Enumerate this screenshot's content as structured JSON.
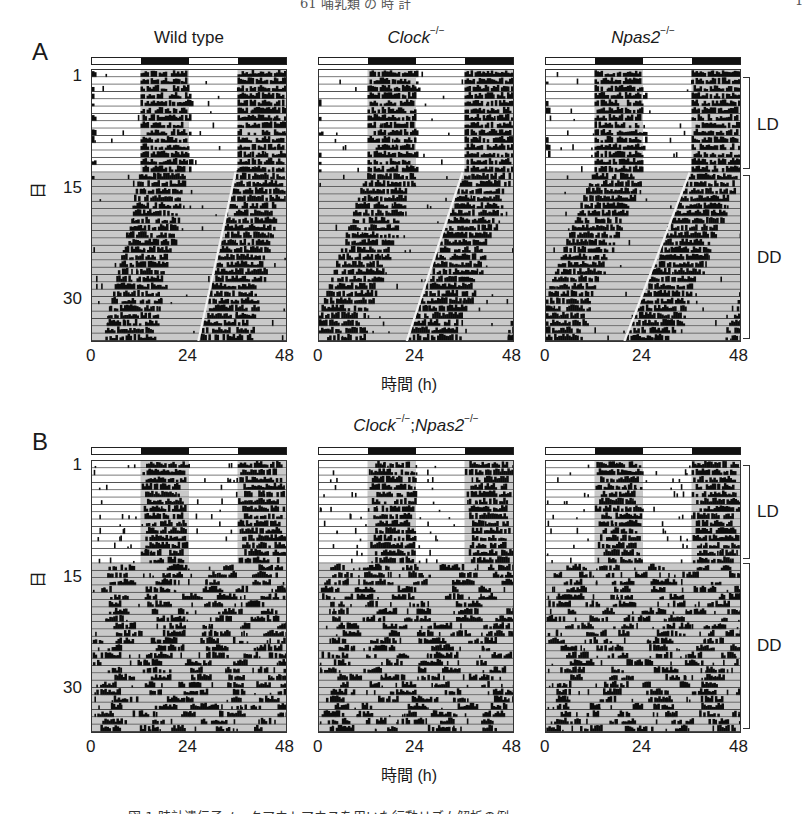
{
  "page": {
    "running_head": "61 哺乳類 の 時 計",
    "page_number": "1",
    "caption": "図 1  時計遺伝子ノックアウトマウスを用いた行動リズム解析の例"
  },
  "panel_a": {
    "letter": "A",
    "titles": [
      {
        "main": "Wild type",
        "italic": false,
        "sup": ""
      },
      {
        "main": "Clock",
        "italic": true,
        "sup": "−/−"
      },
      {
        "main": "Npas2",
        "italic": true,
        "sup": "−/−"
      }
    ],
    "y_ticks": [
      "1",
      "15",
      "30"
    ],
    "y_label": "日",
    "x_ticks": [
      "0",
      "24",
      "48"
    ],
    "x_label": "時間 (h)",
    "brackets": [
      "LD",
      "DD"
    ]
  },
  "panel_b": {
    "letter": "B",
    "title": {
      "main1": "Clock",
      "sup1": "−/−",
      "sep": ";",
      "main2": "Npas2",
      "sup2": "−/−"
    },
    "y_ticks": [
      "1",
      "15",
      "30"
    ],
    "y_label": "日",
    "x_ticks": [
      "0",
      "24",
      "48"
    ],
    "x_label": "時間 (h)",
    "brackets": [
      "LD",
      "DD"
    ]
  },
  "chart_data": [
    {
      "type": "heatmap",
      "title": "Wild type",
      "subtype": "double-plotted actogram",
      "xlabel": "時間 (h)",
      "ylabel": "日",
      "x_ticks": [
        0,
        24,
        48
      ],
      "y_ticks": [
        1,
        15,
        30
      ],
      "days": 37,
      "ld_days": [
        1,
        14
      ],
      "dd_days": [
        15,
        37
      ],
      "light_schedule": "12:12 LD (lights off 12-24h)",
      "activity_onset_ld_h": 12,
      "free_running_period_h": 23.6,
      "rhythm": "robust"
    },
    {
      "type": "heatmap",
      "title": "Clock-/-",
      "subtype": "double-plotted actogram",
      "xlabel": "時間 (h)",
      "ylabel": "日",
      "x_ticks": [
        0,
        24,
        48
      ],
      "y_ticks": [
        1,
        15,
        30
      ],
      "days": 37,
      "ld_days": [
        1,
        14
      ],
      "dd_days": [
        15,
        37
      ],
      "activity_onset_ld_h": 12,
      "free_running_period_h": 23.4,
      "rhythm": "robust"
    },
    {
      "type": "heatmap",
      "title": "Npas2-/-",
      "subtype": "double-plotted actogram",
      "xlabel": "時間 (h)",
      "ylabel": "日",
      "x_ticks": [
        0,
        24,
        48
      ],
      "y_ticks": [
        1,
        15,
        30
      ],
      "days": 37,
      "ld_days": [
        1,
        14
      ],
      "dd_days": [
        15,
        37
      ],
      "activity_onset_ld_h": 12,
      "free_running_period_h": 23.3,
      "rhythm": "robust"
    },
    {
      "type": "heatmap",
      "title": "Clock-/-;Npas2-/- (mouse 1)",
      "subtype": "double-plotted actogram",
      "xlabel": "時間 (h)",
      "ylabel": "日",
      "x_ticks": [
        0,
        24,
        48
      ],
      "y_ticks": [
        1,
        15,
        30
      ],
      "days": 37,
      "ld_days": [
        1,
        14
      ],
      "dd_days": [
        15,
        37
      ],
      "rhythm": "arrhythmic in DD"
    },
    {
      "type": "heatmap",
      "title": "Clock-/-;Npas2-/- (mouse 2)",
      "subtype": "double-plotted actogram",
      "xlabel": "時間 (h)",
      "ylabel": "日",
      "x_ticks": [
        0,
        24,
        48
      ],
      "y_ticks": [
        1,
        15,
        30
      ],
      "days": 37,
      "ld_days": [
        1,
        14
      ],
      "dd_days": [
        15,
        37
      ],
      "rhythm": "arrhythmic in DD"
    },
    {
      "type": "heatmap",
      "title": "Clock-/-;Npas2-/- (mouse 3)",
      "subtype": "double-plotted actogram",
      "xlabel": "時間 (h)",
      "ylabel": "日",
      "x_ticks": [
        0,
        24,
        48
      ],
      "y_ticks": [
        1,
        15,
        30
      ],
      "days": 37,
      "ld_days": [
        1,
        14
      ],
      "dd_days": [
        15,
        37
      ],
      "rhythm": "arrhythmic in DD"
    }
  ],
  "render": {
    "colors": {
      "ink": "#0d0d0d",
      "shade": "#c9c9c9",
      "line": "#3a3a3a",
      "light": "#ffffff"
    }
  }
}
